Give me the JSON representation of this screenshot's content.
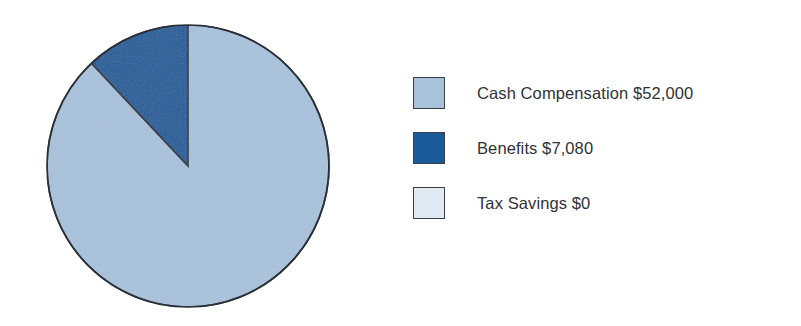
{
  "chart_data": {
    "type": "pie",
    "title": "",
    "subtitle": "",
    "xlabel": "",
    "ylabel": "",
    "grid": false,
    "legend_position": "right",
    "start_angle_deg": 90,
    "direction": "counterclockwise",
    "categories": [
      "Cash Compensation",
      "Benefits",
      "Tax Savings"
    ],
    "values": [
      52000,
      7080,
      0
    ],
    "value_labels": [
      "$52,000",
      "$7,080",
      "$0"
    ],
    "percentages": [
      88.0,
      12.0,
      0.0
    ],
    "slice_colors": [
      "#a9c2dc",
      "#1a5c99",
      "#dfeaf2"
    ],
    "slice_outline_color": "#2a3038",
    "legend_entries": [
      "Cash Compensation $52,000",
      "Benefits $7,080",
      "Tax Savings $0"
    ]
  },
  "pie": {
    "center_x": 188,
    "center_y": 166,
    "radius": 141,
    "slices": [
      {
        "name": "Cash Compensation",
        "value": 52000,
        "value_label": "$52,000",
        "percent": 88.0,
        "color": "#a9c2dc",
        "path": "M 188 25 A 141 141 0 1 1 92.5 69.5 Z"
      },
      {
        "name": "Benefits",
        "value": 7080,
        "value_label": "$7,080",
        "percent": 12.0,
        "color": "#1a5c99",
        "path": "M 188 166 L 188 25 A 141 141 0 0 0 92.5 69.5 Z"
      }
    ],
    "outline_color": "#2a3038",
    "outline_width": 1.6
  },
  "legend": {
    "items": [
      {
        "swatch_name": "cash-compensation",
        "color": "#a9c2dc",
        "label": "Cash Compensation $52,000"
      },
      {
        "swatch_name": "benefits",
        "color": "#1a5c99",
        "label": "Benefits $7,080"
      },
      {
        "swatch_name": "tax-savings",
        "color": "#dfeaf2",
        "label": "Tax Savings $0"
      }
    ]
  },
  "canvas": {
    "background": "#ffffff",
    "width": 801,
    "height": 326
  }
}
